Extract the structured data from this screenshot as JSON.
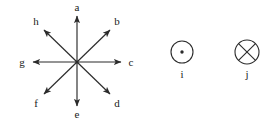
{
  "figure": {
    "background_color": "#ffffff",
    "stroke_color": "#2b2b2b",
    "text_color": "#1a1a1a",
    "star": {
      "name": "eight-direction-arrow-star",
      "center": {
        "x": 77,
        "y": 62
      },
      "arrows": [
        {
          "id": "a",
          "label": "a",
          "direction": "up",
          "angle_deg": 90,
          "tip": {
            "x": 77,
            "y": 16
          },
          "label_pos": {
            "x": 77,
            "y": 7
          }
        },
        {
          "id": "b",
          "label": "b",
          "direction": "up-right",
          "angle_deg": 45,
          "tip": {
            "x": 110,
            "y": 30
          },
          "label_pos": {
            "x": 117,
            "y": 21
          }
        },
        {
          "id": "c",
          "label": "c",
          "direction": "right",
          "angle_deg": 0,
          "tip": {
            "x": 121,
            "y": 62
          },
          "label_pos": {
            "x": 131,
            "y": 62
          }
        },
        {
          "id": "d",
          "label": "d",
          "direction": "down-right",
          "angle_deg": -45,
          "tip": {
            "x": 110,
            "y": 94
          },
          "label_pos": {
            "x": 117,
            "y": 103
          }
        },
        {
          "id": "e",
          "label": "e",
          "direction": "down",
          "angle_deg": -90,
          "tip": {
            "x": 77,
            "y": 106
          },
          "label_pos": {
            "x": 77,
            "y": 114
          }
        },
        {
          "id": "f",
          "label": "f",
          "direction": "down-left",
          "angle_deg": -135,
          "tip": {
            "x": 44,
            "y": 94
          },
          "label_pos": {
            "x": 36,
            "y": 103
          }
        },
        {
          "id": "g",
          "label": "g",
          "direction": "left",
          "angle_deg": 180,
          "tip": {
            "x": 33,
            "y": 62
          },
          "label_pos": {
            "x": 22,
            "y": 62
          }
        },
        {
          "id": "h",
          "label": "h",
          "direction": "up-left",
          "angle_deg": 135,
          "tip": {
            "x": 44,
            "y": 30
          },
          "label_pos": {
            "x": 36,
            "y": 21
          }
        }
      ]
    },
    "symbols": [
      {
        "id": "i",
        "label": "i",
        "glyph": "circle-with-dot",
        "meaning": "out-of-page",
        "center": {
          "x": 182,
          "y": 52
        },
        "radius": 11,
        "label_pos": {
          "x": 182,
          "y": 74
        }
      },
      {
        "id": "j",
        "label": "j",
        "glyph": "circle-with-cross",
        "meaning": "into-page",
        "center": {
          "x": 247,
          "y": 52
        },
        "radius": 12,
        "label_pos": {
          "x": 247,
          "y": 74
        }
      }
    ]
  }
}
